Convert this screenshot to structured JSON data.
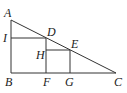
{
  "diagram": {
    "type": "geometry",
    "stroke_color": "#333333",
    "points": {
      "A": {
        "label": "A",
        "x": 11,
        "y": 20
      },
      "B": {
        "label": "B",
        "x": 11,
        "y": 73
      },
      "C": {
        "label": "C",
        "x": 116,
        "y": 73
      },
      "D": {
        "label": "D",
        "x": 46,
        "y": 38
      },
      "E": {
        "label": "E",
        "x": 70,
        "y": 50
      },
      "F": {
        "label": "F",
        "x": 46,
        "y": 73
      },
      "G": {
        "label": "G",
        "x": 70,
        "y": 73
      },
      "H": {
        "label": "H",
        "x": 46,
        "y": 50
      },
      "I": {
        "label": "I",
        "x": 11,
        "y": 38
      }
    },
    "segments": [
      [
        "A",
        "B"
      ],
      [
        "B",
        "C"
      ],
      [
        "A",
        "C"
      ],
      [
        "I",
        "D"
      ],
      [
        "D",
        "F"
      ],
      [
        "H",
        "E"
      ],
      [
        "E",
        "G"
      ]
    ]
  }
}
